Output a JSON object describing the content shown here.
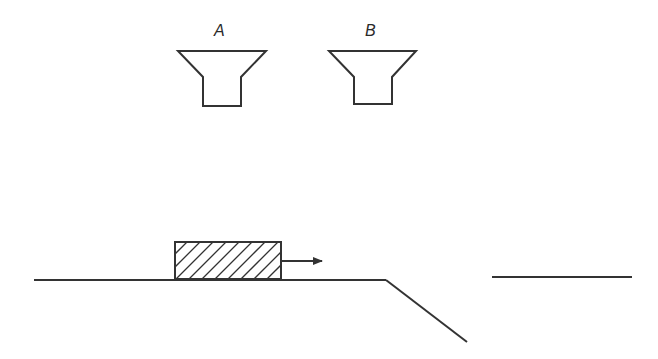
{
  "diagram": {
    "type": "physics-setup",
    "colors": {
      "stroke": "#333333",
      "background": "#ffffff"
    },
    "labels": {
      "funnel_a": "A",
      "funnel_b": "B"
    },
    "elements": [
      {
        "id": "funnel-a",
        "kind": "funnel",
        "label": "A"
      },
      {
        "id": "funnel-b",
        "kind": "funnel",
        "label": "B"
      },
      {
        "id": "block",
        "kind": "hatched-rectangle",
        "motion": "right"
      },
      {
        "id": "velocity-arrow",
        "kind": "arrow",
        "direction": "right"
      },
      {
        "id": "ground",
        "kind": "line"
      },
      {
        "id": "slope",
        "kind": "line",
        "direction": "down-right"
      },
      {
        "id": "far-ledge",
        "kind": "line"
      }
    ]
  }
}
